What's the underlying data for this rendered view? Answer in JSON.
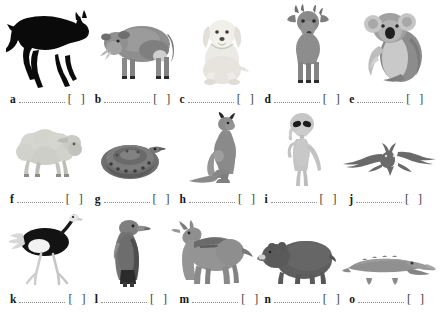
{
  "worksheet": {
    "type": "animal-identification-worksheet",
    "answer_line_placeholder": "",
    "bracket_open": "[",
    "bracket_close": "]",
    "rows": [
      {
        "id": "row-1",
        "items": [
          {
            "letter": "a",
            "animal": "horse",
            "icon": "horse-icon",
            "color": "#0a0a0a"
          },
          {
            "letter": "b",
            "animal": "cow",
            "icon": "cow-icon",
            "color": "#8e8e8e"
          },
          {
            "letter": "c",
            "animal": "dog",
            "icon": "dog-icon",
            "color": "#e8e8e4"
          },
          {
            "letter": "d",
            "animal": "deer",
            "icon": "deer-icon",
            "color": "#8a8a8a"
          },
          {
            "letter": "e",
            "animal": "koala",
            "icon": "koala-icon",
            "color": "#9a9a9a"
          }
        ]
      },
      {
        "id": "row-2",
        "items": [
          {
            "letter": "f",
            "animal": "sheep",
            "icon": "sheep-icon",
            "color": "#c9c9c5"
          },
          {
            "letter": "g",
            "animal": "snake",
            "icon": "snake-icon",
            "color": "#6e6e6e"
          },
          {
            "letter": "h",
            "animal": "kangaroo",
            "icon": "kangaroo-icon",
            "color": "#8c8c8c"
          },
          {
            "letter": "i",
            "animal": "alien",
            "icon": "alien-icon",
            "color": "#c6c6c6"
          },
          {
            "letter": "j",
            "animal": "bat",
            "icon": "bat-icon",
            "color": "#6a6a6a"
          }
        ]
      },
      {
        "id": "row-3",
        "items": [
          {
            "letter": "k",
            "animal": "ostrich",
            "icon": "ostrich-icon",
            "color": "#131313"
          },
          {
            "letter": "l",
            "animal": "eagle",
            "icon": "eagle-icon",
            "color": "#707070"
          },
          {
            "letter": "m",
            "animal": "wolf",
            "icon": "wolf-icon",
            "color": "#949494"
          },
          {
            "letter": "n",
            "animal": "bear",
            "icon": "bear-icon",
            "color": "#5e5e5e"
          },
          {
            "letter": "o",
            "animal": "crocodile",
            "icon": "crocodile-icon",
            "color": "#909090"
          }
        ]
      }
    ]
  }
}
